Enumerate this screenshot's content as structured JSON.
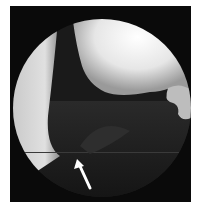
{
  "image": {
    "description": "Arthroscopic view inside a circular scope field with a white arrow pointing to a dark tissue structure",
    "annotation": {
      "type": "arrow",
      "color": "#ffffff",
      "tip": [
        77,
        159
      ],
      "tail": [
        90,
        188
      ]
    },
    "colors": {
      "background": "#ffffff",
      "frame": "#0a0a0a",
      "bright_tissue": "#f2f2f2",
      "dark_tissue": "#1c1c1c"
    }
  }
}
